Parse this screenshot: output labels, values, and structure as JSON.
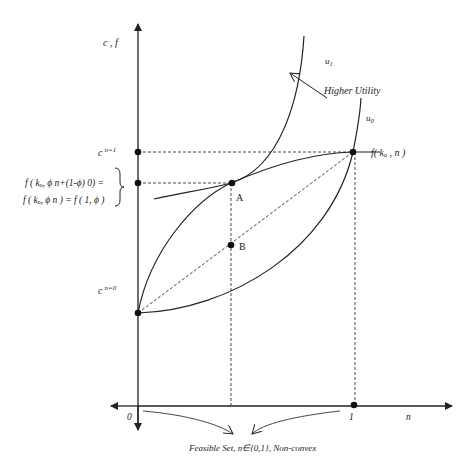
{
  "diagram": {
    "axes": {
      "y_label": "c , f",
      "x_label": "n",
      "x_tick_0": "0",
      "x_tick_1": "1"
    },
    "y_labels": {
      "c_n1_base": "c",
      "c_n1_sup": "n=1",
      "c_n0_base": "c",
      "c_n0_sup": "n=0"
    },
    "brace_label": {
      "line1": "f ( kₒ, ϕ n+(1-ϕ) 0) =",
      "line2": "f ( kₒ, ϕ n ) = f ( 1, ϕ )"
    },
    "curves": {
      "u1": "u1",
      "u1_base": "u",
      "u1_sub": "1",
      "u0_base": "u",
      "u0_sub": "0",
      "f_label": "f( kₒ , n )"
    },
    "points": {
      "A": "A",
      "B": "B"
    },
    "annotations": {
      "higher_utility": "Higher Utility",
      "feasible_set": "Feasible Set, n∈{0,1}, Non-convex"
    },
    "colors": {
      "line": "#222222",
      "background": "#ffffff"
    }
  }
}
